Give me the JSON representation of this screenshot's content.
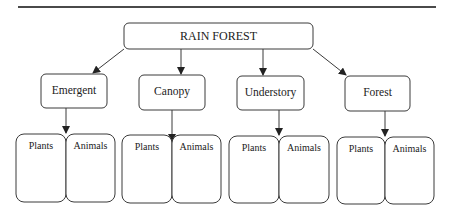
{
  "diagram": {
    "root": {
      "label": "RAIN FOREST"
    },
    "layers": [
      {
        "label": "Emergent",
        "children": [
          {
            "label": "Plants"
          },
          {
            "label": "Animals"
          }
        ]
      },
      {
        "label": "Canopy",
        "children": [
          {
            "label": "Plants"
          },
          {
            "label": "Animals"
          }
        ]
      },
      {
        "label": "Understory",
        "children": [
          {
            "label": "Plants"
          },
          {
            "label": "Animals"
          }
        ]
      },
      {
        "label": "Forest",
        "children": [
          {
            "label": "Plants"
          },
          {
            "label": "Animals"
          }
        ]
      }
    ]
  },
  "colors": {
    "stroke": "#3a3a3a",
    "text": "#222222",
    "background": "#ffffff"
  }
}
